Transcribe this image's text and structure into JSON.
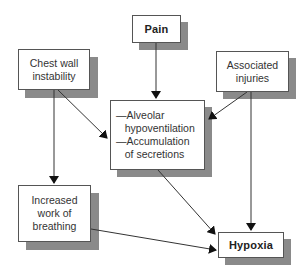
{
  "diagram": {
    "nodes": [
      {
        "id": "pain",
        "label": "Pain",
        "bold": true
      },
      {
        "id": "chest",
        "label": "Chest wall\ninstability",
        "bold": false
      },
      {
        "id": "assoc",
        "label": "Associated\ninjuries",
        "bold": false
      },
      {
        "id": "center",
        "label": "—Alveolar\n   hypoventilation\n—Accumulation\n   of secretions",
        "bold": false
      },
      {
        "id": "work",
        "label": "Increased\nwork of\nbreathing",
        "bold": false
      },
      {
        "id": "hypoxia",
        "label": "Hypoxia",
        "bold": true
      }
    ],
    "edges": [
      {
        "from": "pain",
        "to": "center"
      },
      {
        "from": "chest",
        "to": "center"
      },
      {
        "from": "assoc",
        "to": "center"
      },
      {
        "from": "chest",
        "to": "work"
      },
      {
        "from": "assoc",
        "to": "hypoxia"
      },
      {
        "from": "center",
        "to": "hypoxia"
      },
      {
        "from": "work",
        "to": "hypoxia"
      }
    ],
    "colors": {
      "shadow": "#8a8a8a",
      "border": "#555555",
      "arrow": "#333333"
    }
  }
}
